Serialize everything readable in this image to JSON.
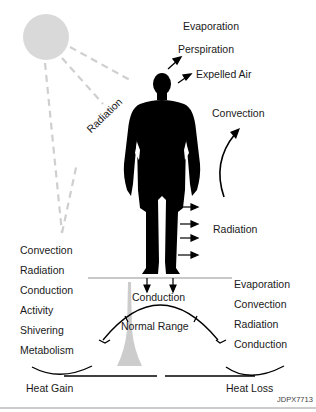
{
  "diagram": {
    "figure_id": "JDPX7713",
    "colors": {
      "silhouette": "#000000",
      "sun": "#d9d9d9",
      "dashed_rays": "#cfcfcf",
      "ground_line": "#c8c8c8",
      "thermometer": "#cccccc",
      "text": "#1a1a1a"
    },
    "icons": {
      "sun": "sun-icon",
      "person": "person-silhouette-icon",
      "thermometer": "thermometer-icon"
    },
    "top_labels": {
      "evaporation": "Evaporation",
      "perspiration": "Perspiration",
      "expelled_air": "Expelled Air",
      "convection": "Convection",
      "radiation_body": "Radiation",
      "radiation_sun": "Radiation"
    },
    "heat_gain": {
      "label": "Heat Gain",
      "mechanisms": [
        "Convection",
        "Radiation",
        "Conduction",
        "Activity",
        "Shivering",
        "Metabolism"
      ]
    },
    "heat_loss": {
      "label": "Heat Loss",
      "mechanisms": [
        "Evaporation",
        "Convection",
        "Radiation",
        "Conduction"
      ]
    },
    "ground": {
      "conduction_label": "Conduction"
    },
    "gauge": {
      "label": "Normal Range"
    }
  }
}
